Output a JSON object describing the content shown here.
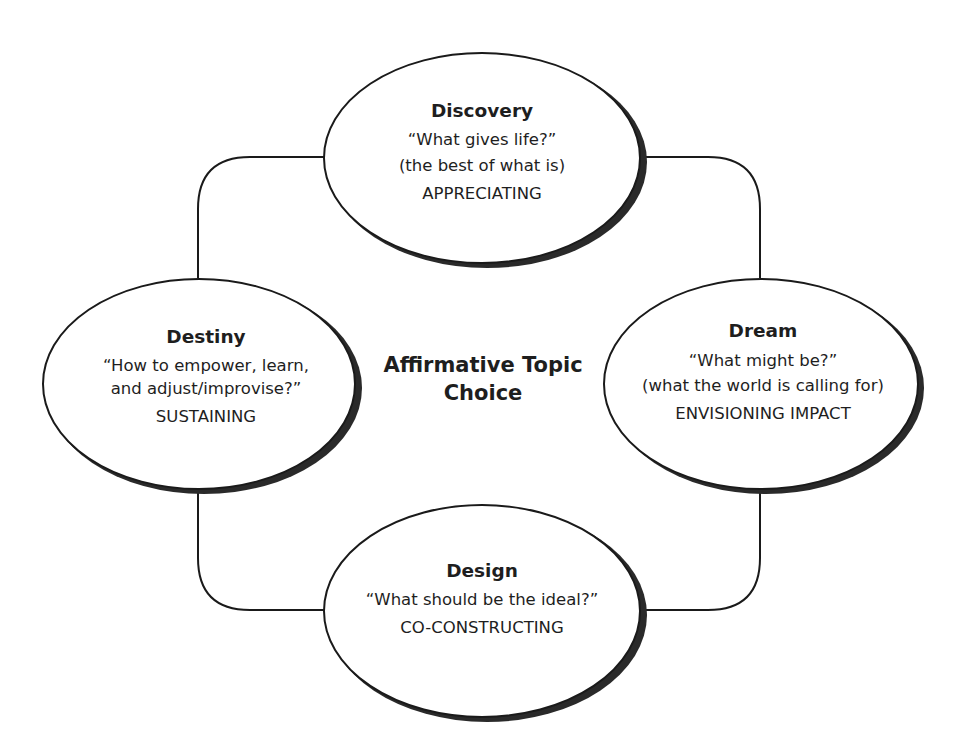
{
  "diagram": {
    "type": "4-D cycle",
    "center": {
      "lines": [
        "Affirmative Topic",
        "Choice"
      ]
    },
    "nodes": {
      "discovery": {
        "title": "Discovery",
        "lines": [
          "“What gives life?”",
          "(the best of what is)",
          "APPRECIATING"
        ]
      },
      "dream": {
        "title": "Dream",
        "lines": [
          "“What might be?”",
          "(what the world is calling for)",
          "ENVISIONING IMPACT"
        ]
      },
      "design": {
        "title": "Design",
        "lines": [
          "“What should be the ideal?”",
          "CO-CONSTRUCTING"
        ]
      },
      "destiny": {
        "title": "Destiny",
        "lines": [
          "“How to empower, learn,",
          "and adjust/improvise?”",
          "SUSTAINING"
        ]
      }
    },
    "connections": [
      {
        "from": "discovery",
        "to": "dream"
      },
      {
        "from": "dream",
        "to": "design"
      },
      {
        "from": "design",
        "to": "destiny"
      },
      {
        "from": "destiny",
        "to": "discovery"
      }
    ]
  }
}
